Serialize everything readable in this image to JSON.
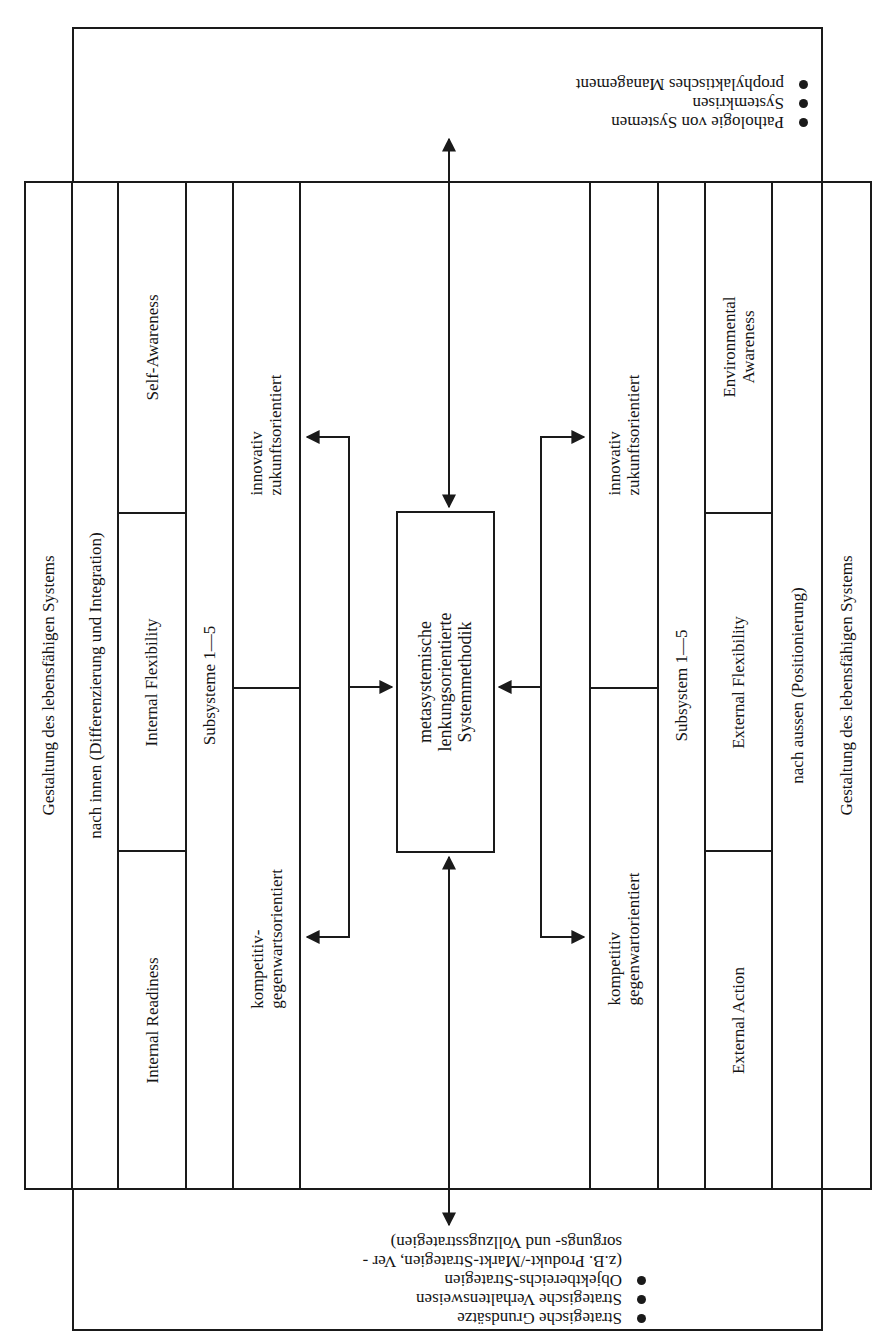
{
  "diagram": {
    "top_box": {
      "items": [
        "Pathologie von Systemen",
        "Systemkrisen",
        "prophylaktisches Management"
      ]
    },
    "bottom_box": {
      "items": [
        "Strategische Grundsätze",
        "Strategische Verhaltensweisen",
        "Objektbereichs-Strategien"
      ],
      "continuation": [
        "(z.B. Produkt-/Markt-Strategien, Ver -",
        "sorgungs- und Vollzugsstrategien)"
      ]
    },
    "left_side": {
      "outer": "Gestaltung des lebensfähigen Systems",
      "direction": "nach innen (Differenzierung und Integration)",
      "readiness": "Internal Readiness",
      "flexibility": "Internal Flexibility",
      "awareness": "Self-Awareness",
      "subsystems": "Subsysteme 1—5",
      "competitive": "kompetitiv-\ngegenwartsorientiert",
      "innovative": "innovativ\nzukunftsorientiert"
    },
    "center": {
      "label": "metasystemische\nlenkungsorientierte\nSystemmethodik"
    },
    "right_side": {
      "competitive": "kompetitiv\ngegenwartorientiert",
      "innovative": "innovativ\nzukunftsorientiert",
      "subsystems": "Subsystem 1—5",
      "action": "External Action",
      "flexibility": "External Flexibility",
      "awareness": "Environmental\nAwareness",
      "direction": "nach aussen (Positionierung)",
      "outer": "Gestaltung des lebensfähigen Systems"
    },
    "colors": {
      "line": "#1a1a1a",
      "background": "#ffffff",
      "text": "#141414"
    }
  }
}
